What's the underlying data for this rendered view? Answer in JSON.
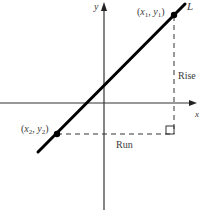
{
  "diagram": {
    "axes": {
      "x_label": "x",
      "y_label": "y"
    },
    "line": {
      "label": "L",
      "color": "#000000"
    },
    "points": [
      {
        "name": "point-1",
        "label_var_x": "x",
        "label_sub_x": "1",
        "label_var_y": "y",
        "label_sub_y": "1"
      },
      {
        "name": "point-2",
        "label_var_x": "x",
        "label_sub_x": "2",
        "label_var_y": "y",
        "label_sub_y": "2"
      }
    ],
    "annotations": {
      "rise": "Rise",
      "run": "Run"
    },
    "punct": {
      "open": "(",
      "comma": ", ",
      "close": ")"
    }
  }
}
